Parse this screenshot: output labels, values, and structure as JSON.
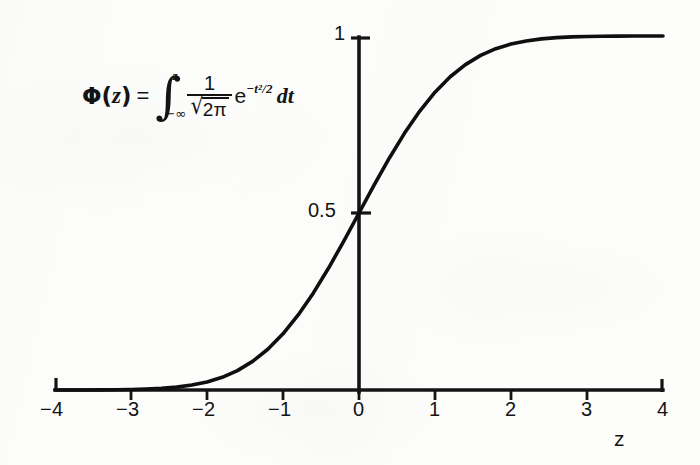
{
  "figure": {
    "title": "",
    "x_axis_title": "z",
    "formula": {
      "lhs_symbol": "Φ",
      "lhs_open": "(",
      "lhs_arg": "z",
      "lhs_close": ")",
      "equals": "=",
      "integral_symbol": "∫",
      "limit_upper": "z",
      "limit_lower": "−∞",
      "numerator": "1",
      "radical": "√",
      "denominator_body": "2π",
      "exp_base": "e",
      "exp_superscript": "−t²/2",
      "differential": "dt",
      "plain_text": "Φ(z) = ∫ from −∞ to z of (1/√(2π)) e^(−t²/2) dt"
    },
    "colors": {
      "ink": "#131313",
      "paper": "#fdfdfc",
      "curve": "#0f0f0f"
    }
  },
  "chart_data": {
    "type": "line",
    "xlabel": "z",
    "ylabel": "",
    "xlim": [
      -4,
      4
    ],
    "ylim": [
      0,
      1
    ],
    "grid": false,
    "legend": null,
    "x_ticks": [
      -4,
      -3,
      -2,
      -1,
      0,
      1,
      2,
      3,
      4
    ],
    "x_tick_labels": [
      "−4",
      "−3",
      "−2",
      "−1",
      "0",
      "1",
      "2",
      "3",
      "4"
    ],
    "y_ticks": [
      0.5,
      1
    ],
    "y_tick_labels": [
      "0.5",
      "1"
    ],
    "annotations": [
      {
        "text": "Φ(z) = ∫_{−∞}^{z} (1/√(2π)) e^{−t²/2} dt",
        "x": -2.6,
        "y": 0.83
      }
    ],
    "series": [
      {
        "name": "Φ(z)",
        "x": [
          -4,
          -3.8,
          -3.6,
          -3.4,
          -3.2,
          -3,
          -2.8,
          -2.6,
          -2.4,
          -2.2,
          -2,
          -1.8,
          -1.6,
          -1.4,
          -1.2,
          -1,
          -0.8,
          -0.6,
          -0.4,
          -0.2,
          0,
          0.2,
          0.4,
          0.6,
          0.8,
          1,
          1.2,
          1.4,
          1.6,
          1.8,
          2,
          2.2,
          2.4,
          2.6,
          2.8,
          3,
          3.2,
          3.4,
          3.6,
          3.8,
          4
        ],
        "values": [
          3e-05,
          7e-05,
          0.00016,
          0.00034,
          0.00069,
          0.00135,
          0.00256,
          0.00466,
          0.0082,
          0.0139,
          0.0228,
          0.0359,
          0.0548,
          0.0808,
          0.1151,
          0.1587,
          0.2119,
          0.2743,
          0.3446,
          0.4207,
          0.5,
          0.5793,
          0.6554,
          0.7257,
          0.7881,
          0.8413,
          0.8849,
          0.9192,
          0.9452,
          0.9641,
          0.9772,
          0.9861,
          0.9918,
          0.9953,
          0.9974,
          0.9987,
          0.9993,
          0.9997,
          0.9998,
          0.9999,
          0.99997
        ]
      }
    ]
  }
}
